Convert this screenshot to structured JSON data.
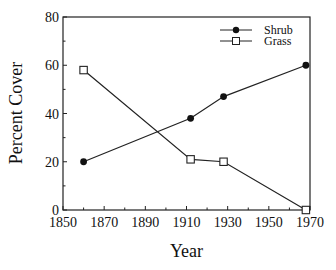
{
  "chart_data": {
    "type": "line",
    "title": "",
    "xlabel": "Year",
    "ylabel": "Percent Cover",
    "xlim": [
      1850,
      1970
    ],
    "ylim": [
      0,
      80
    ],
    "xticks": [
      1850,
      1870,
      1890,
      1910,
      1930,
      1950,
      1970
    ],
    "yticks": [
      0,
      20,
      40,
      60,
      80
    ],
    "grid": false,
    "legend_position": "upper right",
    "series": [
      {
        "name": "Shrub",
        "marker": "filled-circle",
        "x": [
          1860,
          1912,
          1928,
          1968
        ],
        "values": [
          20,
          38,
          47,
          60
        ]
      },
      {
        "name": "Grass",
        "marker": "open-square",
        "x": [
          1860,
          1912,
          1928,
          1968
        ],
        "values": [
          58,
          21,
          20,
          0
        ]
      }
    ]
  },
  "labels": {
    "xlabel": "Year",
    "ylabel": "Percent Cover",
    "legend_shrub": "Shrub",
    "legend_grass": "Grass",
    "xtick_0": "1850",
    "xtick_1": "1870",
    "xtick_2": "1890",
    "xtick_3": "1910",
    "xtick_4": "1930",
    "xtick_5": "1950",
    "xtick_6": "1970",
    "ytick_0": "0",
    "ytick_1": "20",
    "ytick_2": "40",
    "ytick_3": "60",
    "ytick_4": "80"
  }
}
